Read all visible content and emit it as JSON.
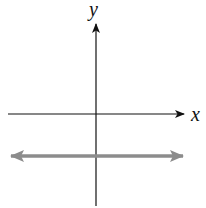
{
  "diagram": {
    "type": "coordinate-plane",
    "axes": {
      "x_label": "x",
      "y_label": "y",
      "axis_color": "#111111"
    },
    "lines": [
      {
        "description": "horizontal line below the x-axis with arrows on both ends",
        "orientation": "horizontal",
        "position": "below x-axis",
        "color": "#8c8c8c"
      }
    ]
  }
}
